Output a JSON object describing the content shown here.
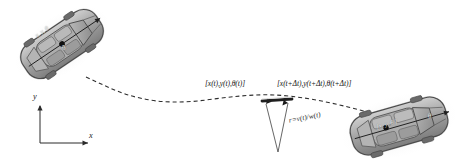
{
  "figure": {
    "background_color": "#ffffff",
    "width": 467,
    "height": 162
  },
  "labels": {
    "pose_t": "[x(t),y(t),θ(t)]",
    "pose_t_delta": "[x(t+Δt),y(t+Δt),θ(t+Δt)]",
    "radius": "r=v(t)/w(t)"
  },
  "axes": {
    "x_label": "x",
    "y_label": "y",
    "origin_x": 40,
    "origin_y": 143,
    "x_end": 88,
    "y_end": 106,
    "color": "#2b2b2b"
  },
  "vehicles": [
    {
      "name": "car-start",
      "center_x": 62,
      "center_y": 44,
      "rotation_deg": -34,
      "body_color": "#9d9d9d",
      "body_light": "#c3c3c3",
      "body_dark": "#6f6f6f",
      "outline_color": "#4a4a4a",
      "overlay_text": "x, y, θ",
      "overlay_theta": "θ"
    },
    {
      "name": "car-end",
      "center_x": 399,
      "center_y": 126,
      "rotation_deg": -16,
      "body_color": "#9d9d9d",
      "body_light": "#c3c3c3",
      "body_dark": "#6f6f6f",
      "outline_color": "#4a4a4a",
      "overlay_text": "[x, y, θ ]",
      "overlay_theta": "θ"
    }
  ],
  "trajectory": {
    "name": "dashed-path",
    "style": "dashed",
    "color": "#2e2e2e",
    "dash_pattern": "4,3",
    "width": 1.1,
    "points": [
      [
        86,
        77
      ],
      [
        110,
        87
      ],
      [
        134,
        96
      ],
      [
        158,
        101
      ],
      [
        178,
        102
      ],
      [
        200,
        100
      ],
      [
        225,
        97
      ],
      [
        250,
        95
      ],
      [
        272,
        95
      ],
      [
        296,
        96
      ],
      [
        320,
        100
      ],
      [
        344,
        105
      ],
      [
        366,
        111
      ]
    ]
  },
  "icr": {
    "name": "instantaneous-center-of-rotation",
    "apex_x": 278,
    "apex_y": 152,
    "left_x": 266,
    "left_y": 104,
    "right_x": 288,
    "right_y": 103,
    "line_color": "#4a4a4a"
  },
  "axle": {
    "name": "wheel-axle",
    "x1": 263,
    "y1": 101,
    "x2": 291,
    "y2": 99,
    "color": "#1f1f1f",
    "width": 2.6
  },
  "markers": {
    "center_dot_color": "#111111",
    "start_dot": {
      "x": 62,
      "y": 44,
      "r": 2.8
    },
    "end_dot": {
      "x": 399,
      "y": 124,
      "r": 2.8
    }
  },
  "label_positions": {
    "pose_t": {
      "x": 207,
      "y": 84
    },
    "pose_t_delta": {
      "x": 278,
      "y": 84
    },
    "radius": {
      "x": 288,
      "y": 118
    },
    "x_axis": {
      "x": 90,
      "y": 137
    },
    "y_axis": {
      "x": 34,
      "y": 96
    }
  }
}
